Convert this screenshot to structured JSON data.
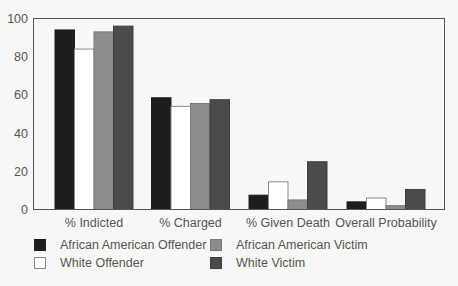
{
  "chart_data": {
    "type": "bar",
    "title": "",
    "xlabel": "",
    "ylabel": "",
    "ylim": [
      0,
      100
    ],
    "yticks": [
      0,
      20,
      40,
      60,
      80,
      100
    ],
    "grid": false,
    "legend_position": "bottom",
    "categories": [
      "% Indicted",
      "% Charged",
      "% Given Death",
      "Overall Probability"
    ],
    "series": [
      {
        "name": "African American Offender",
        "color": "#1f1d1b",
        "border": "#1f1d1b",
        "values": [
          94,
          58.5,
          7.5,
          4
        ]
      },
      {
        "name": "White Offender",
        "color": "#ffffff",
        "border": "#8a8a8a",
        "values": [
          84,
          54,
          14.5,
          6
        ]
      },
      {
        "name": "African American Victim",
        "color": "#8c8c8c",
        "border": "#7a7a7a",
        "values": [
          93,
          55.5,
          5,
          2
        ]
      },
      {
        "name": "White Victim",
        "color": "#4b4b4b",
        "border": "#3f3f3f",
        "values": [
          96,
          57.5,
          25,
          10.5
        ]
      }
    ]
  },
  "legend": {
    "items": [
      {
        "label": "African American Offender",
        "color": "#1f1d1b",
        "border": "#1f1d1b"
      },
      {
        "label": "White Offender",
        "color": "#ffffff",
        "border": "#8a8a8a"
      },
      {
        "label": "African American Victim",
        "color": "#8c8c8c",
        "border": "#7a7a7a"
      },
      {
        "label": "White Victim",
        "color": "#4b4b4b",
        "border": "#3f3f3f"
      }
    ]
  }
}
